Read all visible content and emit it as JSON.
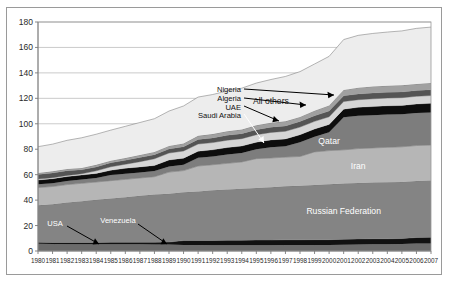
{
  "chart_data": {
    "type": "area",
    "stacked": true,
    "title": "",
    "subtitle": "",
    "xlabel": "",
    "ylabel": "",
    "xlim": [
      1980,
      2007
    ],
    "ylim": [
      0,
      180
    ],
    "grid": true,
    "legend_position": "none (in-plot area labels)",
    "x": [
      1980,
      1981,
      1982,
      1983,
      1984,
      1985,
      1986,
      1987,
      1988,
      1989,
      1990,
      1991,
      1992,
      1993,
      1994,
      1995,
      1996,
      1997,
      1998,
      1999,
      2000,
      2001,
      2002,
      2003,
      2004,
      2005,
      2006,
      2007
    ],
    "ytick_labels": [
      "0",
      "20",
      "40",
      "60",
      "80",
      "100",
      "120",
      "140",
      "160",
      "180"
    ],
    "ytick_values": [
      0,
      20,
      40,
      60,
      80,
      100,
      120,
      140,
      160,
      180
    ],
    "xtick_labels": [
      "1980",
      "1981",
      "1982",
      "1983",
      "1984",
      "1985",
      "1986",
      "1987",
      "1988",
      "1989",
      "1990",
      "1991",
      "1992",
      "1993",
      "1994",
      "1995",
      "1996",
      "1997",
      "1998",
      "1999",
      "2000",
      "2001",
      "2002",
      "2003",
      "2004",
      "2005",
      "2006",
      "2007"
    ],
    "series": [
      {
        "name": "USA",
        "color": "#6b6b6b",
        "label_kind": "callout",
        "values": [
          5.7,
          5.5,
          5.4,
          5.3,
          5.3,
          5.3,
          5.3,
          5.3,
          5.2,
          5.2,
          4.8,
          4.7,
          4.6,
          4.6,
          4.6,
          4.6,
          4.6,
          4.7,
          4.7,
          4.7,
          4.7,
          5.0,
          5.2,
          5.3,
          5.3,
          5.5,
          5.8,
          5.9
        ]
      },
      {
        "name": "Venezuela",
        "color": "#111111",
        "label_kind": "callout",
        "values": [
          1.2,
          1.2,
          1.3,
          1.4,
          1.4,
          1.5,
          1.5,
          1.6,
          1.7,
          1.8,
          3.4,
          3.6,
          3.7,
          3.8,
          3.9,
          4.0,
          4.0,
          4.1,
          4.1,
          4.2,
          4.2,
          4.2,
          4.3,
          4.3,
          4.3,
          4.3,
          4.8,
          5.0
        ]
      },
      {
        "name": "Russian Federation",
        "color": "#848484",
        "label_kind": "inline",
        "values": [
          29.0,
          30.0,
          31.5,
          32.5,
          33.5,
          34.5,
          35.5,
          36.5,
          37.5,
          38.0,
          38.0,
          38.5,
          39.5,
          40.0,
          40.5,
          41.0,
          41.5,
          42.0,
          42.5,
          43.0,
          43.5,
          43.8,
          44.0,
          44.2,
          44.4,
          44.5,
          44.5,
          44.6
        ]
      },
      {
        "name": "Iran",
        "color": "#b6b6b6",
        "label_kind": "inline",
        "values": [
          14.0,
          14.0,
          14.0,
          14.0,
          14.0,
          14.0,
          14.0,
          14.0,
          14.0,
          17.0,
          17.0,
          20.0,
          20.0,
          20.5,
          21.0,
          23.0,
          23.0,
          23.0,
          23.0,
          26.0,
          26.5,
          26.5,
          27.0,
          27.2,
          27.5,
          27.6,
          27.8,
          27.8
        ]
      },
      {
        "name": "Qatar",
        "color": "#7d7d7d",
        "label_kind": "inline",
        "values": [
          2.5,
          2.6,
          2.8,
          3.0,
          3.2,
          4.4,
          4.4,
          4.4,
          4.4,
          4.5,
          4.6,
          6.4,
          6.4,
          7.0,
          7.1,
          7.4,
          8.5,
          8.5,
          11.2,
          12.0,
          14.4,
          25.6,
          25.8,
          25.8,
          25.8,
          25.6,
          25.6,
          25.6
        ]
      },
      {
        "name": "Saudi Arabia",
        "color": "#0d0d0d",
        "label_kind": "callout",
        "values": [
          3.4,
          3.5,
          3.5,
          3.5,
          3.6,
          3.7,
          4.3,
          4.3,
          4.4,
          5.0,
          5.2,
          5.2,
          5.3,
          5.4,
          5.4,
          5.5,
          5.7,
          5.8,
          5.9,
          6.0,
          6.2,
          6.4,
          6.6,
          6.7,
          6.8,
          6.9,
          7.0,
          7.2
        ]
      },
      {
        "name": "UAE",
        "color": "#d6d6d6",
        "label_kind": "callout",
        "values": [
          0.7,
          0.8,
          0.9,
          1.0,
          2.0,
          2.8,
          3.2,
          4.1,
          5.3,
          5.5,
          5.6,
          5.7,
          5.7,
          5.8,
          5.8,
          5.9,
          5.9,
          6.0,
          6.0,
          6.0,
          6.0,
          6.0,
          6.0,
          6.1,
          6.1,
          6.1,
          6.1,
          6.1
        ]
      },
      {
        "name": "Algeria",
        "color": "#545454",
        "label_kind": "callout",
        "values": [
          3.7,
          3.7,
          3.7,
          3.1,
          3.1,
          3.1,
          3.1,
          3.2,
          3.2,
          3.2,
          3.3,
          3.6,
          3.7,
          3.8,
          3.9,
          4.0,
          4.1,
          4.2,
          4.3,
          4.4,
          4.5,
          4.5,
          4.5,
          4.5,
          4.5,
          4.5,
          4.5,
          4.5
        ]
      },
      {
        "name": "Nigeria",
        "color": "#a0a0a0",
        "label_kind": "callout",
        "values": [
          1.2,
          1.3,
          1.4,
          1.5,
          1.6,
          1.7,
          1.8,
          2.0,
          2.2,
          2.4,
          2.6,
          2.8,
          3.0,
          3.2,
          3.3,
          3.4,
          3.5,
          3.6,
          3.7,
          4.0,
          4.4,
          4.6,
          5.0,
          5.2,
          5.2,
          5.2,
          5.2,
          5.3
        ]
      },
      {
        "name": "All others",
        "color": "#ededed",
        "label_kind": "inline",
        "values": [
          20.6,
          21.4,
          22.5,
          23.7,
          24.1,
          24.0,
          24.9,
          25.6,
          26.1,
          27.4,
          29.5,
          30.5,
          31.1,
          31.7,
          32.5,
          33.2,
          34.0,
          35.3,
          35.6,
          36.7,
          38.6,
          39.6,
          41.1,
          41.7,
          42.2,
          42.8,
          43.7,
          44.0
        ]
      }
    ],
    "annotations": [
      {
        "label": "All others",
        "kind": "area-label"
      },
      {
        "label": "Qatar",
        "kind": "area-label"
      },
      {
        "label": "Iran",
        "kind": "area-label"
      },
      {
        "label": "Russian Federation",
        "kind": "area-label"
      },
      {
        "label": "Nigeria",
        "kind": "leader-line"
      },
      {
        "label": "Algeria",
        "kind": "leader-line"
      },
      {
        "label": "UAE",
        "kind": "leader-line"
      },
      {
        "label": "Saudi Arabia",
        "kind": "leader-line"
      },
      {
        "label": "USA",
        "kind": "leader-line"
      },
      {
        "label": "Venezuela",
        "kind": "leader-line"
      }
    ]
  }
}
